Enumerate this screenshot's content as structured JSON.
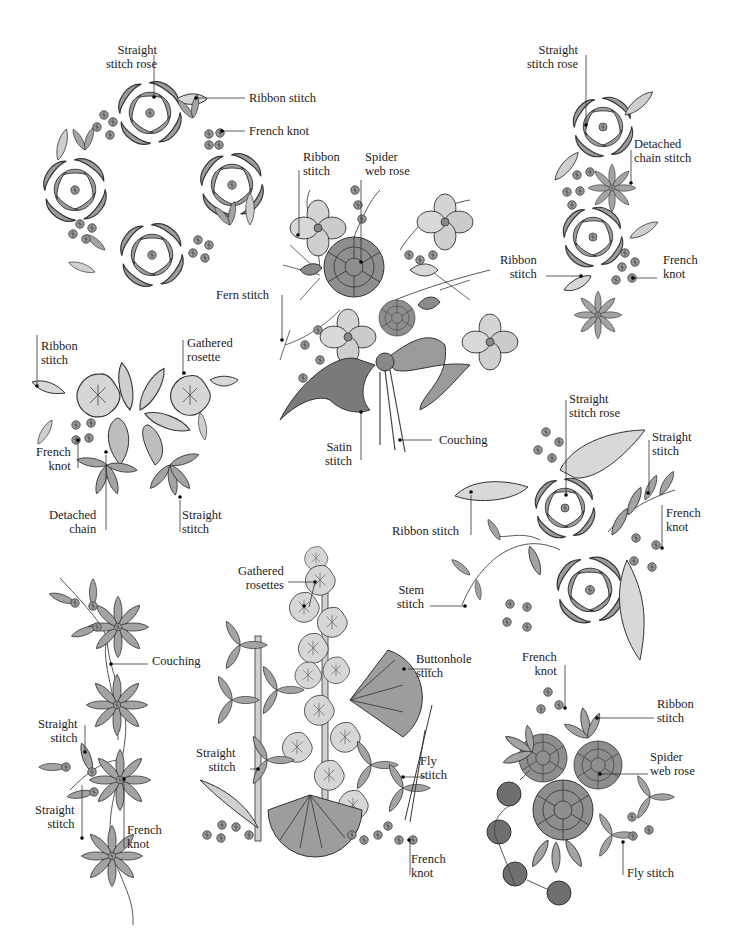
{
  "diagram": {
    "colors": {
      "ink": "#2a2a2a",
      "fill_light": "#d2d2d2",
      "fill_mid": "#a8a8a8",
      "fill_dark": "#6e6e6e",
      "paper": "#ffffff"
    },
    "motifs": [
      {
        "id": "wreath",
        "labels": [
          {
            "lines": [
              "Straight",
              "stitch rose"
            ]
          },
          {
            "lines": [
              "Ribbon stitch"
            ]
          },
          {
            "lines": [
              "French knot"
            ]
          }
        ]
      },
      {
        "id": "bouquet",
        "labels": [
          {
            "lines": [
              "Ribbon",
              "stitch"
            ]
          },
          {
            "lines": [
              "Spider",
              "web rose"
            ]
          },
          {
            "lines": [
              "Fern stitch"
            ]
          },
          {
            "lines": [
              "Satin",
              "stitch"
            ]
          },
          {
            "lines": [
              "Couching"
            ]
          }
        ]
      },
      {
        "id": "vertical-spray",
        "labels": [
          {
            "lines": [
              "Straight",
              "stitch rose"
            ]
          },
          {
            "lines": [
              "Detached",
              "chain stitch"
            ]
          },
          {
            "lines": [
              "Ribbon",
              "stitch"
            ]
          },
          {
            "lines": [
              "French",
              "knot"
            ]
          }
        ]
      },
      {
        "id": "rosette-cluster",
        "labels": [
          {
            "lines": [
              "Ribbon",
              "stitch"
            ]
          },
          {
            "lines": [
              "Gathered",
              "rosette"
            ]
          },
          {
            "lines": [
              "French",
              "knot"
            ]
          },
          {
            "lines": [
              "Detached",
              "chain"
            ]
          },
          {
            "lines": [
              "Straight",
              "stitch"
            ]
          }
        ]
      },
      {
        "id": "rose-branch",
        "labels": [
          {
            "lines": [
              "Straight",
              "stitch rose"
            ]
          },
          {
            "lines": [
              "Straight",
              "stitch"
            ]
          },
          {
            "lines": [
              "Ribbon stitch"
            ]
          },
          {
            "lines": [
              "French",
              "knot"
            ]
          },
          {
            "lines": [
              "Stem",
              "stitch"
            ]
          }
        ]
      },
      {
        "id": "daisy-vine",
        "labels": [
          {
            "lines": [
              "Couching"
            ]
          },
          {
            "lines": [
              "Straight",
              "stitch"
            ]
          },
          {
            "lines": [
              "Straight",
              "stitch"
            ]
          },
          {
            "lines": [
              "French",
              "knot"
            ]
          }
        ]
      },
      {
        "id": "hollyhock",
        "labels": [
          {
            "lines": [
              "Gathered",
              "rosettes"
            ]
          },
          {
            "lines": [
              "Buttonhole",
              "stitch"
            ]
          },
          {
            "lines": [
              "Straight",
              "stitch"
            ]
          },
          {
            "lines": [
              "Fly",
              "stitch"
            ]
          },
          {
            "lines": [
              "French",
              "knot"
            ]
          }
        ]
      },
      {
        "id": "spider-rose-cluster",
        "labels": [
          {
            "lines": [
              "French",
              "knot"
            ]
          },
          {
            "lines": [
              "Ribbon",
              "stitch"
            ]
          },
          {
            "lines": [
              "Spider",
              "web rose"
            ]
          },
          {
            "lines": [
              "Fly stitch"
            ]
          }
        ]
      }
    ]
  }
}
